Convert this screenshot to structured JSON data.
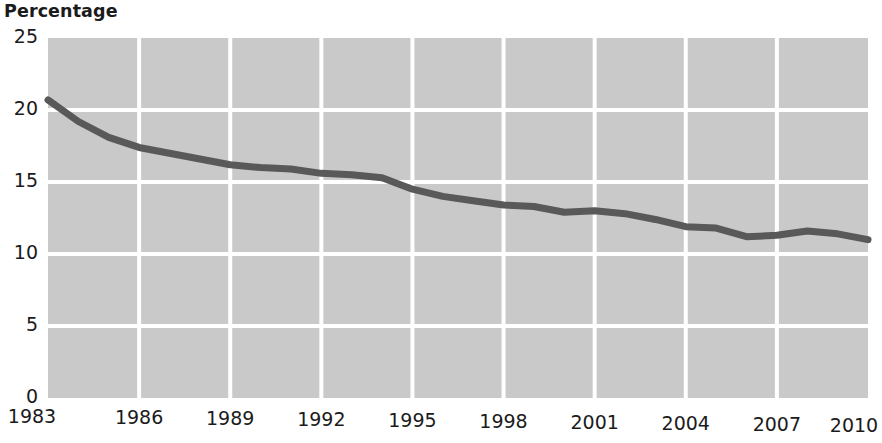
{
  "chart_data": {
    "type": "line",
    "title": "Percentage",
    "xlabel": "",
    "ylabel": "Percentage",
    "xlim": [
      1983,
      2010
    ],
    "ylim": [
      0,
      25
    ],
    "grid": true,
    "legend": "none",
    "plot_background_color": "#c9c9c9",
    "grid_color": "#ffffff",
    "line_color": "#595959",
    "line_width_px": 7,
    "text_color": "#1b1b1b",
    "y_ticks": [
      0,
      5,
      10,
      15,
      20,
      25
    ],
    "y_tick_labels": [
      "0",
      "5",
      "10",
      "15",
      "20",
      "25"
    ],
    "x_ticks": [
      1983,
      1986,
      1989,
      1992,
      1995,
      1998,
      2001,
      2004,
      2007,
      2010
    ],
    "x_tick_labels": [
      "1983",
      "1986",
      "1989",
      "1992",
      "1995",
      "1998",
      "2001",
      "2004",
      "2007",
      "2010"
    ],
    "x": [
      1983,
      1984,
      1985,
      1986,
      1987,
      1988,
      1989,
      1990,
      1991,
      1992,
      1993,
      1994,
      1995,
      1996,
      1997,
      1998,
      1999,
      2000,
      2001,
      2002,
      2003,
      2004,
      2005,
      2006,
      2007,
      2008,
      2009,
      2010
    ],
    "series": [
      {
        "name": "Percentage",
        "values": [
          20.7,
          19.2,
          18.1,
          17.4,
          17.0,
          16.6,
          16.2,
          16.0,
          15.9,
          15.6,
          15.5,
          15.3,
          14.5,
          14.0,
          13.7,
          13.4,
          13.3,
          12.9,
          13.0,
          12.8,
          12.4,
          11.9,
          11.8,
          11.2,
          11.3,
          11.6,
          11.4,
          11.0
        ]
      }
    ]
  },
  "plot_geometry": {
    "left_px": 48,
    "right_px": 868,
    "top_px": 38,
    "bottom_px": 398
  }
}
